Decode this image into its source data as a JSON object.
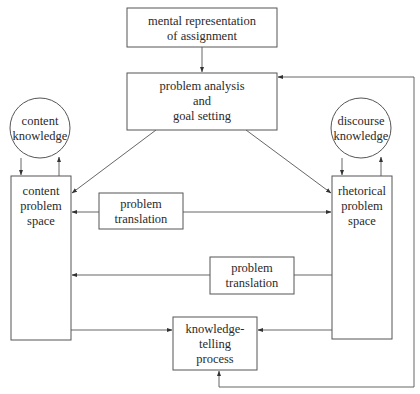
{
  "diagram": {
    "type": "flow-diagram",
    "nodes": {
      "mental_representation": {
        "lines": [
          "mental representation",
          "of assignment"
        ],
        "shape": "rectangle"
      },
      "problem_analysis": {
        "lines": [
          "problem analysis",
          "and",
          "goal setting"
        ],
        "shape": "rectangle"
      },
      "content_knowledge": {
        "lines": [
          "content",
          "knowledge"
        ],
        "shape": "circle"
      },
      "discourse_knowledge": {
        "lines": [
          "discourse",
          "knowledge"
        ],
        "shape": "circle"
      },
      "content_problem_space": {
        "lines": [
          "content",
          "problem",
          "space"
        ],
        "shape": "rectangle"
      },
      "rhetorical_problem_space": {
        "lines": [
          "rhetorical",
          "problem",
          "space"
        ],
        "shape": "rectangle"
      },
      "problem_translation_1": {
        "lines": [
          "problem",
          "translation"
        ],
        "shape": "rectangle"
      },
      "problem_translation_2": {
        "lines": [
          "problem",
          "translation"
        ],
        "shape": "rectangle"
      },
      "knowledge_telling": {
        "lines": [
          "knowledge-",
          "telling",
          "process"
        ],
        "shape": "rectangle"
      }
    },
    "edges": [
      {
        "from": "mental_representation",
        "to": "problem_analysis"
      },
      {
        "from": "problem_analysis",
        "to": "content_problem_space"
      },
      {
        "from": "problem_analysis",
        "to": "rhetorical_problem_space"
      },
      {
        "from": "content_knowledge",
        "to": "content_problem_space"
      },
      {
        "from": "content_problem_space",
        "to": "content_knowledge"
      },
      {
        "from": "discourse_knowledge",
        "to": "rhetorical_problem_space"
      },
      {
        "from": "rhetorical_problem_space",
        "to": "discourse_knowledge"
      },
      {
        "from": "problem_translation_1",
        "to": "content_problem_space"
      },
      {
        "from": "problem_translation_1",
        "to": "rhetorical_problem_space"
      },
      {
        "from": "rhetorical_problem_space",
        "to": "problem_translation_2"
      },
      {
        "from": "problem_translation_2",
        "to": "content_problem_space"
      },
      {
        "from": "content_problem_space",
        "to": "knowledge_telling"
      },
      {
        "from": "rhetorical_problem_space",
        "to": "knowledge_telling"
      },
      {
        "from": "knowledge_telling",
        "to": "problem_analysis",
        "note": "feedback loop via right side"
      }
    ]
  }
}
